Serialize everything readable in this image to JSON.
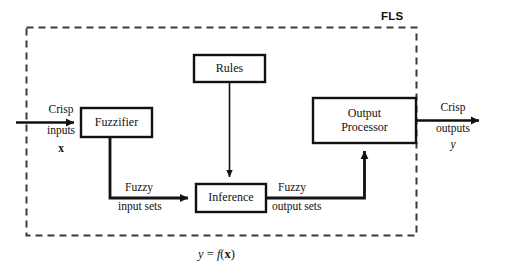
{
  "diagram": {
    "title": "FLS",
    "equation": {
      "lhs": "y",
      "eq": " = ",
      "fn": "f",
      "open": "(",
      "arg": "x",
      "close": ")"
    },
    "boundary": {
      "style": "dashed",
      "color": "#3a3a3a"
    },
    "blocks": [
      {
        "id": "fuzzifier",
        "label": "Fuzzifier",
        "line2": ""
      },
      {
        "id": "rules",
        "label": "Rules",
        "line2": ""
      },
      {
        "id": "inference",
        "label": "Inference",
        "line2": ""
      },
      {
        "id": "output-processor",
        "label": "Output",
        "line2": "Processor"
      }
    ],
    "io": {
      "input": {
        "line1": "Crisp",
        "line2": "inputs",
        "symbol": "x"
      },
      "output": {
        "line1": "Crisp",
        "line2": "outputs",
        "symbol": "y"
      }
    },
    "edges": [
      {
        "id": "fuzzy-input-sets",
        "line1": "Fuzzy",
        "line2": "input sets"
      },
      {
        "id": "fuzzy-output-sets",
        "line1": "Fuzzy",
        "line2": "output sets"
      }
    ],
    "colors": {
      "stroke": "#111111",
      "dashed": "#3a3a3a",
      "background": "#ffffff"
    }
  }
}
